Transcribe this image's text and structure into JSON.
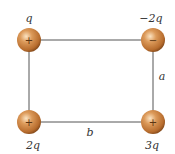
{
  "diagram": {
    "type": "charge-rectangle",
    "charges": [
      {
        "id": "top-left",
        "label": "q",
        "sign": "+",
        "cx": 29,
        "cy": 40
      },
      {
        "id": "top-right",
        "label": "−2q",
        "sign": "−",
        "cx": 153,
        "cy": 40
      },
      {
        "id": "bottom-left",
        "label": "2q",
        "sign": "+",
        "cx": 29,
        "cy": 122
      },
      {
        "id": "bottom-right",
        "label": "3q",
        "sign": "+",
        "cx": 153,
        "cy": 122
      }
    ],
    "sides": {
      "vertical_label": "a",
      "horizontal_label": "b"
    },
    "colors": {
      "sphere": "#c7803f",
      "sphere_highlight": "#f6d4a8",
      "sphere_shadow": "#8a4e1c",
      "line": "#555555"
    }
  }
}
